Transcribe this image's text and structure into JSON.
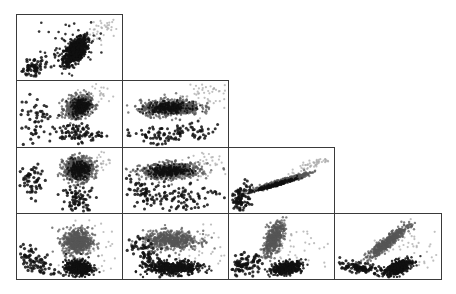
{
  "chart_data": {
    "type": "scatter",
    "title": "",
    "layout": "scatterplot-matrix-lower-triangle",
    "grid": false,
    "legend": null,
    "n_vars": 4,
    "axis_labels": [],
    "tick_labels": [],
    "series": [
      {
        "name": "group-dark",
        "color": "#111111"
      },
      {
        "name": "group-mid",
        "color": "#555555"
      },
      {
        "name": "group-light",
        "color": "#aaaaaa"
      }
    ],
    "panels": [
      {
        "row": 0,
        "col": 0,
        "clusters": [
          {
            "series": 0,
            "n": 900,
            "cx": 0.55,
            "cy": 0.55,
            "sx": 0.055,
            "sy": 0.1,
            "r": 0.55,
            "size": 1.2
          },
          {
            "series": 0,
            "n": 70,
            "cx": 0.15,
            "cy": 0.8,
            "sx": 0.08,
            "sy": 0.08,
            "r": 0.5,
            "size": 1.6
          },
          {
            "series": 0,
            "n": 40,
            "cx": 0.5,
            "cy": 0.45,
            "sx": 0.17,
            "sy": 0.2,
            "r": 0.3,
            "size": 1.3
          },
          {
            "series": 2,
            "n": 40,
            "cx": 0.82,
            "cy": 0.2,
            "sx": 0.08,
            "sy": 0.1,
            "r": 0.4,
            "size": 1.1
          }
        ]
      },
      {
        "row": 1,
        "col": 0,
        "clusters": [
          {
            "series": 1,
            "n": 650,
            "cx": 0.58,
            "cy": 0.38,
            "sx": 0.06,
            "sy": 0.08,
            "r": 0.2,
            "size": 1.2
          },
          {
            "series": 0,
            "n": 300,
            "cx": 0.6,
            "cy": 0.38,
            "sx": 0.04,
            "sy": 0.06,
            "r": 0.2,
            "size": 1.1
          },
          {
            "series": 0,
            "n": 90,
            "cx": 0.55,
            "cy": 0.78,
            "sx": 0.12,
            "sy": 0.07,
            "r": 0.0,
            "size": 1.5
          },
          {
            "series": 0,
            "n": 50,
            "cx": 0.17,
            "cy": 0.6,
            "sx": 0.08,
            "sy": 0.2,
            "r": 0.3,
            "size": 1.6
          },
          {
            "series": 2,
            "n": 30,
            "cx": 0.8,
            "cy": 0.15,
            "sx": 0.06,
            "sy": 0.1,
            "r": 0.0,
            "size": 1.1
          }
        ]
      },
      {
        "row": 1,
        "col": 1,
        "clusters": [
          {
            "series": 1,
            "n": 650,
            "cx": 0.45,
            "cy": 0.4,
            "sx": 0.14,
            "sy": 0.06,
            "r": 0.1,
            "size": 1.2
          },
          {
            "series": 0,
            "n": 300,
            "cx": 0.43,
            "cy": 0.4,
            "sx": 0.1,
            "sy": 0.04,
            "r": 0.1,
            "size": 1.1
          },
          {
            "series": 0,
            "n": 110,
            "cx": 0.45,
            "cy": 0.8,
            "sx": 0.25,
            "sy": 0.08,
            "r": 0.3,
            "size": 1.5
          },
          {
            "series": 2,
            "n": 50,
            "cx": 0.75,
            "cy": 0.2,
            "sx": 0.12,
            "sy": 0.12,
            "r": 0.0,
            "size": 1.1
          }
        ]
      },
      {
        "row": 2,
        "col": 0,
        "clusters": [
          {
            "series": 1,
            "n": 650,
            "cx": 0.58,
            "cy": 0.32,
            "sx": 0.07,
            "sy": 0.09,
            "r": 0.0,
            "size": 1.2
          },
          {
            "series": 0,
            "n": 280,
            "cx": 0.58,
            "cy": 0.33,
            "sx": 0.05,
            "sy": 0.06,
            "r": 0.0,
            "size": 1.1
          },
          {
            "series": 0,
            "n": 80,
            "cx": 0.58,
            "cy": 0.78,
            "sx": 0.08,
            "sy": 0.1,
            "r": 0.0,
            "size": 1.5
          },
          {
            "series": 0,
            "n": 55,
            "cx": 0.15,
            "cy": 0.5,
            "sx": 0.07,
            "sy": 0.15,
            "r": 0.0,
            "size": 1.6
          },
          {
            "series": 2,
            "n": 30,
            "cx": 0.8,
            "cy": 0.18,
            "sx": 0.06,
            "sy": 0.1,
            "r": 0.0,
            "size": 1.1
          }
        ]
      },
      {
        "row": 2,
        "col": 1,
        "clusters": [
          {
            "series": 1,
            "n": 650,
            "cx": 0.45,
            "cy": 0.35,
            "sx": 0.14,
            "sy": 0.06,
            "r": 0.1,
            "size": 1.2
          },
          {
            "series": 0,
            "n": 300,
            "cx": 0.44,
            "cy": 0.35,
            "sx": 0.1,
            "sy": 0.04,
            "r": 0.1,
            "size": 1.1
          },
          {
            "series": 0,
            "n": 110,
            "cx": 0.5,
            "cy": 0.72,
            "sx": 0.22,
            "sy": 0.12,
            "r": 0.0,
            "size": 1.5
          },
          {
            "series": 0,
            "n": 40,
            "cx": 0.15,
            "cy": 0.65,
            "sx": 0.08,
            "sy": 0.12,
            "r": -0.5,
            "size": 1.6
          },
          {
            "series": 2,
            "n": 45,
            "cx": 0.75,
            "cy": 0.2,
            "sx": 0.12,
            "sy": 0.12,
            "r": 0.0,
            "size": 1.1
          }
        ]
      },
      {
        "row": 2,
        "col": 2,
        "clusters": [
          {
            "series": 1,
            "n": 700,
            "cx": 0.48,
            "cy": 0.52,
            "sx": 0.12,
            "sy": 0.06,
            "r": 0.96,
            "size": 1.2
          },
          {
            "series": 0,
            "n": 220,
            "cx": 0.45,
            "cy": 0.55,
            "sx": 0.1,
            "sy": 0.05,
            "r": 0.96,
            "size": 1.1
          },
          {
            "series": 0,
            "n": 110,
            "cx": 0.1,
            "cy": 0.78,
            "sx": 0.06,
            "sy": 0.12,
            "r": 0.3,
            "size": 1.5
          },
          {
            "series": 2,
            "n": 50,
            "cx": 0.78,
            "cy": 0.25,
            "sx": 0.12,
            "sy": 0.07,
            "r": 0.9,
            "size": 1.1
          }
        ]
      },
      {
        "row": 3,
        "col": 0,
        "clusters": [
          {
            "series": 1,
            "n": 550,
            "cx": 0.57,
            "cy": 0.42,
            "sx": 0.07,
            "sy": 0.1,
            "r": 0.0,
            "size": 1.2
          },
          {
            "series": 0,
            "n": 500,
            "cx": 0.58,
            "cy": 0.82,
            "sx": 0.06,
            "sy": 0.06,
            "r": 0.0,
            "size": 1.2
          },
          {
            "series": 0,
            "n": 80,
            "cx": 0.18,
            "cy": 0.72,
            "sx": 0.1,
            "sy": 0.12,
            "r": -0.6,
            "size": 1.6
          },
          {
            "series": 2,
            "n": 40,
            "cx": 0.72,
            "cy": 0.55,
            "sx": 0.15,
            "sy": 0.25,
            "r": 0.0,
            "size": 1.1
          }
        ]
      },
      {
        "row": 3,
        "col": 1,
        "clusters": [
          {
            "series": 1,
            "n": 550,
            "cx": 0.45,
            "cy": 0.4,
            "sx": 0.13,
            "sy": 0.07,
            "r": 0.0,
            "size": 1.2
          },
          {
            "series": 0,
            "n": 500,
            "cx": 0.48,
            "cy": 0.82,
            "sx": 0.13,
            "sy": 0.05,
            "r": 0.0,
            "size": 1.2
          },
          {
            "series": 0,
            "n": 80,
            "cx": 0.25,
            "cy": 0.62,
            "sx": 0.12,
            "sy": 0.15,
            "r": -0.7,
            "size": 1.6
          },
          {
            "series": 2,
            "n": 40,
            "cx": 0.72,
            "cy": 0.45,
            "sx": 0.15,
            "sy": 0.2,
            "r": 0.0,
            "size": 1.1
          }
        ]
      },
      {
        "row": 3,
        "col": 2,
        "clusters": [
          {
            "series": 1,
            "n": 450,
            "cx": 0.42,
            "cy": 0.38,
            "sx": 0.05,
            "sy": 0.13,
            "r": 0.6,
            "size": 1.2
          },
          {
            "series": 0,
            "n": 450,
            "cx": 0.55,
            "cy": 0.82,
            "sx": 0.07,
            "sy": 0.05,
            "r": 0.4,
            "size": 1.2
          },
          {
            "series": 0,
            "n": 90,
            "cx": 0.15,
            "cy": 0.78,
            "sx": 0.08,
            "sy": 0.08,
            "r": 0.0,
            "size": 1.6
          },
          {
            "series": 2,
            "n": 40,
            "cx": 0.68,
            "cy": 0.55,
            "sx": 0.15,
            "sy": 0.2,
            "r": 0.0,
            "size": 1.1
          }
        ]
      },
      {
        "row": 3,
        "col": 3,
        "clusters": [
          {
            "series": 1,
            "n": 450,
            "cx": 0.5,
            "cy": 0.42,
            "sx": 0.1,
            "sy": 0.13,
            "r": 0.93,
            "size": 1.2
          },
          {
            "series": 0,
            "n": 400,
            "cx": 0.6,
            "cy": 0.8,
            "sx": 0.06,
            "sy": 0.06,
            "r": 0.5,
            "size": 1.2
          },
          {
            "series": 0,
            "n": 140,
            "cx": 0.25,
            "cy": 0.82,
            "sx": 0.13,
            "sy": 0.05,
            "r": -0.7,
            "size": 1.5
          },
          {
            "series": 2,
            "n": 40,
            "cx": 0.75,
            "cy": 0.5,
            "sx": 0.15,
            "sy": 0.15,
            "r": 0.0,
            "size": 1.1
          }
        ]
      }
    ]
  },
  "layout_hints": {
    "origin_x": 16,
    "origin_y": 14,
    "col_edges": [
      16,
      122,
      228,
      334,
      441
    ],
    "row_edges": [
      14,
      80,
      147,
      213,
      279
    ]
  }
}
